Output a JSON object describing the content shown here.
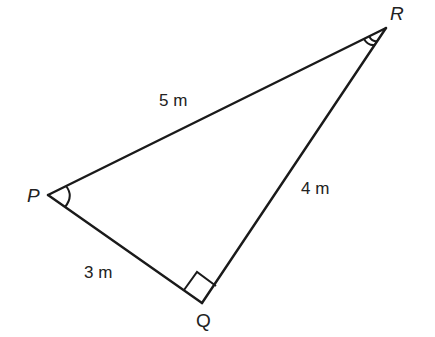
{
  "diagram": {
    "type": "right-triangle",
    "vertices": {
      "P": {
        "label": "P",
        "x": 48,
        "y": 195
      },
      "Q": {
        "label": "Q",
        "x": 202,
        "y": 303
      },
      "R": {
        "label": "R",
        "x": 386,
        "y": 28
      }
    },
    "sides": {
      "PR": {
        "label": "5 m"
      },
      "QR": {
        "label": "4 m"
      },
      "PQ": {
        "label": "3 m"
      }
    },
    "angle_marks": {
      "P": "single-arc",
      "R": "double-arc",
      "Q": "right-angle-square"
    },
    "colors": {
      "line": "#1a1a1a",
      "text": "#222222",
      "background": "#ffffff"
    }
  }
}
